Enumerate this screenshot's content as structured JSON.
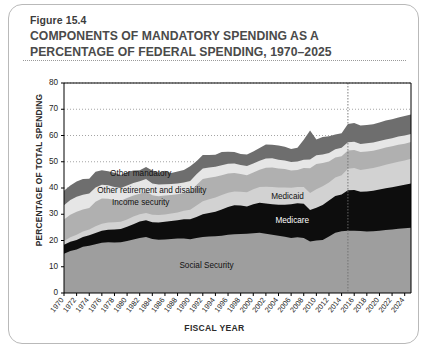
{
  "figure": {
    "number": "Figure 15.4",
    "title_line1": "COMPONENTS OF MANDATORY SPENDING AS A",
    "title_line2": "PERCENTAGE OF FEDERAL SPENDING, 1970–2025"
  },
  "colors": {
    "card_border": "#b9b9b9",
    "axis": "#000000",
    "gridline": "#9a9a9a",
    "social_security": "#9e9e9e",
    "medicare": "#0d0d0d",
    "medicaid": "#d2d2d2",
    "income_security": "#b0b0b0",
    "other_retirement": "#e6e6e6",
    "other_mandatory": "#6e6e6e",
    "plot_background": "#ffffff",
    "projection_line": "#6e6e6e"
  },
  "chart_data": {
    "type": "area",
    "stacked": true,
    "title": "COMPONENTS OF MANDATORY SPENDING AS A PERCENTAGE OF FEDERAL SPENDING, 1970–2025",
    "xlabel": "FISCAL YEAR",
    "ylabel": "PERCENTAGE OF TOTAL SPENDING",
    "ylim": [
      0,
      80
    ],
    "xlim": [
      1970,
      2025
    ],
    "yticks": [
      0,
      10,
      20,
      30,
      40,
      50,
      60,
      70,
      80
    ],
    "grid": "horizontal-dotted",
    "legend_position": "inline-labels",
    "projection_marker_year": 2015,
    "xtick_labels": [
      "1970",
      "1972",
      "1974",
      "1976",
      "1978",
      "1980",
      "1982",
      "1984",
      "1986",
      "1988",
      "1990",
      "1992",
      "1994",
      "1996",
      "1998",
      "2000",
      "2002",
      "2004",
      "2006",
      "2008",
      "2010",
      "2012",
      "2014",
      "2016",
      "2018",
      "2020",
      "2022",
      "2024"
    ],
    "x": [
      1970,
      1971,
      1972,
      1973,
      1974,
      1975,
      1976,
      1977,
      1978,
      1979,
      1980,
      1981,
      1982,
      1983,
      1984,
      1985,
      1986,
      1987,
      1988,
      1989,
      1990,
      1991,
      1992,
      1993,
      1994,
      1995,
      1996,
      1997,
      1998,
      1999,
      2000,
      2001,
      2002,
      2003,
      2004,
      2005,
      2006,
      2007,
      2008,
      2009,
      2010,
      2011,
      2012,
      2013,
      2014,
      2015,
      2016,
      2017,
      2018,
      2019,
      2020,
      2021,
      2022,
      2023,
      2024,
      2025
    ],
    "series": [
      {
        "name": "Social Security",
        "label": "Social Security",
        "color": "#9e9e9e",
        "values": [
          15.0,
          16.0,
          16.6,
          17.6,
          18.0,
          18.6,
          19.1,
          19.3,
          19.2,
          19.3,
          19.8,
          20.4,
          21.0,
          21.3,
          20.6,
          20.3,
          20.4,
          20.6,
          20.8,
          20.8,
          20.5,
          21.0,
          21.3,
          21.5,
          21.6,
          21.8,
          22.2,
          22.4,
          22.5,
          22.6,
          22.8,
          23.0,
          22.6,
          22.2,
          21.8,
          21.4,
          21.0,
          21.2,
          21.0,
          19.6,
          20.0,
          20.2,
          21.5,
          23.0,
          23.5,
          23.7,
          23.7,
          23.6,
          23.4,
          23.5,
          23.7,
          24.0,
          24.2,
          24.5,
          24.7,
          24.9
        ]
      },
      {
        "name": "Medicare",
        "label": "Medicare",
        "color": "#0d0d0d",
        "values": [
          3.4,
          3.5,
          3.6,
          3.7,
          4.0,
          4.3,
          4.6,
          4.8,
          5.0,
          5.1,
          5.4,
          5.8,
          6.2,
          6.4,
          6.4,
          6.6,
          6.7,
          6.8,
          6.9,
          7.3,
          7.6,
          8.0,
          8.7,
          9.0,
          9.4,
          10.0,
          10.6,
          11.0,
          10.8,
          10.4,
          11.0,
          11.4,
          11.5,
          11.6,
          11.8,
          12.2,
          12.8,
          13.0,
          13.0,
          12.0,
          12.5,
          13.3,
          13.7,
          14.0,
          14.0,
          15.4,
          15.5,
          15.0,
          15.3,
          15.5,
          15.7,
          15.9,
          16.1,
          16.3,
          16.5,
          16.8
        ]
      },
      {
        "name": "Medicaid",
        "label": "Medicaid",
        "color": "#d2d2d2",
        "values": [
          1.4,
          1.7,
          2.0,
          2.1,
          2.2,
          2.5,
          2.7,
          2.8,
          2.8,
          2.7,
          2.8,
          2.9,
          2.8,
          2.8,
          2.8,
          2.8,
          2.8,
          2.9,
          3.0,
          3.2,
          3.6,
          4.3,
          5.0,
          5.2,
          5.4,
          5.5,
          5.4,
          5.3,
          5.3,
          5.4,
          5.7,
          6.0,
          6.4,
          6.6,
          6.6,
          6.6,
          6.3,
          6.2,
          6.4,
          6.5,
          7.0,
          7.2,
          6.9,
          7.0,
          7.4,
          8.2,
          8.4,
          8.3,
          8.5,
          8.6,
          8.8,
          9.0,
          9.1,
          9.2,
          9.3,
          9.4
        ]
      },
      {
        "name": "Income security",
        "label": "Income security",
        "color": "#b0b0b0",
        "values": [
          8.2,
          8.6,
          8.8,
          8.4,
          8.2,
          9.4,
          9.6,
          9.0,
          8.4,
          8.0,
          8.2,
          8.0,
          7.8,
          8.2,
          7.4,
          7.2,
          7.2,
          7.0,
          6.9,
          6.8,
          7.0,
          7.8,
          8.4,
          8.2,
          7.9,
          7.6,
          7.3,
          7.0,
          6.7,
          6.5,
          6.4,
          6.6,
          7.2,
          7.4,
          7.2,
          7.0,
          6.6,
          6.5,
          7.2,
          9.4,
          9.6,
          8.8,
          8.0,
          7.6,
          7.2,
          7.0,
          6.9,
          6.8,
          6.7,
          6.6,
          6.6,
          6.5,
          6.5,
          6.5,
          6.4,
          6.4
        ]
      },
      {
        "name": "Other retirement and disability",
        "label": "Other retirement and disability",
        "color": "#e6e6e6",
        "values": [
          5.4,
          5.6,
          5.7,
          5.6,
          5.5,
          5.4,
          5.2,
          5.1,
          5.0,
          4.9,
          4.8,
          4.8,
          4.8,
          4.7,
          4.5,
          4.4,
          4.3,
          4.2,
          4.1,
          4.0,
          4.0,
          4.1,
          4.0,
          3.9,
          3.8,
          3.8,
          3.7,
          3.6,
          3.5,
          3.5,
          3.4,
          3.4,
          3.5,
          3.5,
          3.4,
          3.3,
          3.2,
          3.2,
          3.2,
          3.4,
          3.4,
          3.3,
          3.2,
          3.2,
          3.2,
          3.1,
          3.1,
          3.1,
          3.1,
          3.1,
          3.1,
          3.1,
          3.1,
          3.1,
          3.1,
          3.1
        ]
      },
      {
        "name": "Other mandatory",
        "label": "Other mandatory",
        "color": "#6e6e6e",
        "values": [
          5.6,
          5.6,
          5.8,
          6.0,
          5.6,
          6.0,
          5.6,
          5.4,
          5.4,
          5.0,
          5.0,
          4.8,
          4.2,
          4.6,
          5.0,
          4.6,
          5.2,
          4.2,
          4.6,
          4.8,
          5.6,
          5.0,
          5.2,
          4.8,
          4.6,
          5.0,
          4.6,
          4.4,
          4.2,
          4.4,
          4.6,
          4.8,
          5.4,
          5.2,
          5.4,
          5.2,
          5.0,
          5.2,
          7.6,
          11.0,
          6.0,
          6.6,
          6.4,
          5.6,
          5.6,
          7.0,
          7.2,
          7.0,
          7.0,
          7.0,
          7.1,
          7.2,
          7.2,
          7.3,
          7.4,
          7.4
        ]
      }
    ]
  }
}
